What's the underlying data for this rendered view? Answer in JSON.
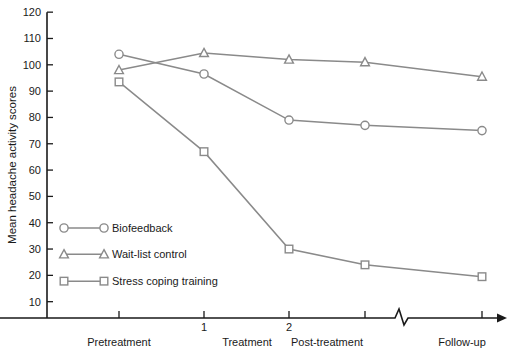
{
  "chart_data": {
    "type": "line",
    "title": "",
    "xlabel": "",
    "ylabel": "Mean headache activity scores",
    "ylim": [
      0,
      120
    ],
    "ytick_step": 10,
    "yticks": [
      10,
      20,
      30,
      40,
      50,
      60,
      70,
      80,
      90,
      100,
      110,
      120
    ],
    "grid": false,
    "legend_position": "inside-left",
    "axis_break": true,
    "axis_break_note": "zigzag break on x-axis between Post-treatment and Follow-up",
    "x": [
      "Pretreatment",
      "1",
      "2",
      "Post-treatment",
      "Follow-up"
    ],
    "categories": [
      "Pretreatment",
      "1",
      "2",
      "Post-treatment",
      "Follow-up"
    ],
    "phase_labels": [
      "Pretreatment",
      "Treatment",
      "Post-treatment",
      "Follow-up"
    ],
    "inner_tick_labels": [
      "1",
      "2"
    ],
    "series": [
      {
        "name": "Biofeedback",
        "marker": "circle",
        "color": "#8a8a8a",
        "values": [
          104,
          96.5,
          79,
          77,
          75
        ]
      },
      {
        "name": "Wait-list control",
        "marker": "triangle",
        "color": "#8a8a8a",
        "values": [
          98,
          104.5,
          102,
          101,
          95.5
        ]
      },
      {
        "name": "Stress coping training",
        "marker": "square",
        "color": "#8a8a8a",
        "values": [
          93.5,
          67,
          30,
          24,
          19.5
        ]
      }
    ]
  },
  "legend": {
    "items": [
      {
        "label": "Biofeedback",
        "marker": "circle"
      },
      {
        "label": "Wait-list control",
        "marker": "triangle"
      },
      {
        "label": "Stress coping training",
        "marker": "square"
      }
    ]
  },
  "colors": {
    "axis": "#1a1a1a",
    "series": "#8a8a8a",
    "background": "#ffffff",
    "marker_fill": "#ffffff"
  }
}
